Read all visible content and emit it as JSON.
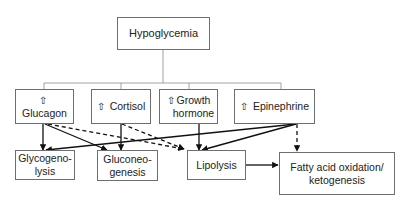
{
  "diagram": {
    "root": {
      "label": "Hypoglycemia"
    },
    "hormones": [
      {
        "id": "glucagon",
        "icon": "up-arrow-icon",
        "glyph": "⇧",
        "label": "Glucagon"
      },
      {
        "id": "cortisol",
        "icon": "up-arrow-icon",
        "glyph": "⇧",
        "label": "Cortisol"
      },
      {
        "id": "growth-hormone",
        "icon": "up-arrow-icon",
        "glyph": "⇧",
        "label_line1": "Growth",
        "label_line2": "hormone"
      },
      {
        "id": "epinephrine",
        "icon": "up-arrow-icon",
        "glyph": "⇧",
        "label": "Epinephrine"
      }
    ],
    "processes": [
      {
        "id": "glycogenolysis",
        "label_line1": "Glycogeno-",
        "label_line2": "lysis"
      },
      {
        "id": "gluconeogenesis",
        "label_line1": "Gluconeo-",
        "label_line2": "genesis"
      },
      {
        "id": "lipolysis",
        "label": "Lipolysis"
      },
      {
        "id": "fatty-acid-oxidation",
        "label_line1": "Fatty acid oxidation/",
        "label_line2": "ketogenesis"
      }
    ],
    "edges": [
      {
        "from": "hypoglycemia",
        "to": [
          "glucagon",
          "cortisol",
          "growth-hormone",
          "epinephrine"
        ],
        "style": "tree"
      },
      {
        "from": "glucagon",
        "to": "glycogenolysis",
        "style": "solid"
      },
      {
        "from": "glucagon",
        "to": "gluconeogenesis",
        "style": "solid"
      },
      {
        "from": "glucagon",
        "to": "lipolysis",
        "style": "dashed"
      },
      {
        "from": "cortisol",
        "to": "gluconeogenesis",
        "style": "solid"
      },
      {
        "from": "cortisol",
        "to": "lipolysis",
        "style": "dashed"
      },
      {
        "from": "growth-hormone",
        "to": "lipolysis",
        "style": "solid"
      },
      {
        "from": "epinephrine",
        "to": "glycogenolysis",
        "style": "solid"
      },
      {
        "from": "epinephrine",
        "to": "lipolysis",
        "style": "solid"
      },
      {
        "from": "epinephrine",
        "to": "fatty-acid-oxidation",
        "style": "dashed"
      },
      {
        "from": "lipolysis",
        "to": "fatty-acid-oxidation",
        "style": "solid"
      }
    ],
    "colors": {
      "line": "#222222",
      "box_border": "#6e6e6e",
      "background": "#ffffff"
    }
  }
}
